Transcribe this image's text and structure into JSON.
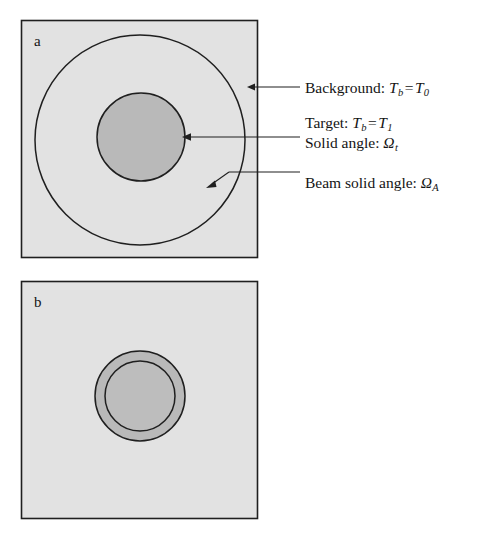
{
  "figure": {
    "type": "diagram",
    "panels": [
      {
        "id": "a",
        "letter": "a",
        "caption_letter": "a",
        "frame": {
          "x": 21,
          "y": 20,
          "width": 237,
          "height": 238
        },
        "background_fill": "#e2e2e2",
        "shapes": [
          {
            "name": "beam-circle",
            "kind": "circle",
            "cx": 140,
            "cy": 140,
            "r": 105,
            "fill": "none",
            "stroke": "#1f1f1f"
          },
          {
            "name": "target-disc",
            "kind": "circle",
            "cx": 141,
            "cy": 137,
            "r": 44,
            "fill": "#b9b9b9",
            "stroke": "#1f1f1f"
          }
        ]
      },
      {
        "id": "b",
        "letter": "b",
        "caption_letter": "b",
        "frame": {
          "x": 21,
          "y": 281,
          "width": 237,
          "height": 238
        },
        "background_fill": "#e2e2e2",
        "shapes": [
          {
            "name": "beam-circle",
            "kind": "circle",
            "cx": 140,
            "cy": 396,
            "r": 45,
            "fill": "#b9b9b9",
            "stroke": "#1f1f1f"
          },
          {
            "name": "target-disc",
            "kind": "circle",
            "cx": 140,
            "cy": 396,
            "r": 35,
            "fill": "#bdbdbd",
            "stroke": "#1f1f1f"
          }
        ]
      }
    ]
  },
  "annotations": [
    {
      "name": "background-label",
      "prefix": "Background:",
      "symbol": "T",
      "symbol_sub": "b",
      "equals": "=",
      "value": "T",
      "value_sub": "0",
      "full_text": "Background: T_b = T_0",
      "arrow": {
        "tip_x": 248,
        "tip_y": 87,
        "tail_x": 300,
        "tail_y": 87
      }
    },
    {
      "name": "target-label",
      "prefix": "Target:",
      "symbol": "T",
      "symbol_sub": "b",
      "equals": "=",
      "value": "T",
      "value_sub": "1",
      "full_text": "Target: T_b = T_1",
      "second_line_prefix": "Solid angle:",
      "second_line_symbol": "Ω",
      "second_line_sub": "t",
      "second_line_full": "Solid angle: Ω_t",
      "arrow": {
        "tip_x": 183,
        "tip_y": 137,
        "tail_x": 300,
        "tail_y": 137
      }
    },
    {
      "name": "beam-label",
      "prefix": "Beam solid angle:",
      "symbol": "Ω",
      "symbol_sub": "A",
      "full_text": "Beam solid angle: Ω_A",
      "arrow": {
        "tip_x": 208,
        "tip_y": 186,
        "elbow_x": 228,
        "elbow_y": 172,
        "tail_x": 300,
        "tail_y": 172
      }
    }
  ],
  "colors": {
    "page_background": "#ffffff",
    "panel_fill": "#e2e2e2",
    "disc_fill": "#b9b9b9",
    "stroke": "#1f1f1f",
    "text": "#141414"
  },
  "caption_sliver": ""
}
